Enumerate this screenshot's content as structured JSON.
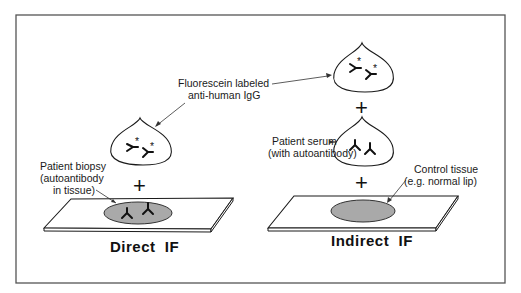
{
  "diagram": {
    "labels": {
      "fluorescein_line1": "Fluorescein labeled",
      "fluorescein_line2": "anti-human IgG",
      "biopsy_line1": "Patient biopsy",
      "biopsy_line2": "(autoantibody",
      "biopsy_line3": "in tissue)",
      "serum_line1": "Patient serum",
      "serum_line2": "(with autoantibody)",
      "control_line1": "Control tissue",
      "control_line2": "(e.g. normal lip)"
    },
    "titles": {
      "direct": "Direct  IF",
      "indirect": "Indirect  IF"
    },
    "symbols": {
      "plus": "+",
      "asterisk": "*"
    },
    "colors": {
      "frame": "#555555",
      "tissue_fill": "#a9a9a9",
      "line": "#1a1a1a"
    }
  }
}
